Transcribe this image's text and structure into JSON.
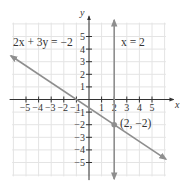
{
  "chart_data": {
    "type": "line",
    "title": "",
    "xlabel": "x",
    "ylabel": "y",
    "xlim": [
      -6.2,
      6.2
    ],
    "ylim": [
      -6.2,
      6.2
    ],
    "grid": true,
    "x_ticks": [
      -5,
      -4,
      -3,
      -2,
      -1,
      1,
      2,
      3,
      4,
      5
    ],
    "y_ticks": [
      5,
      4,
      3,
      2,
      1,
      -1,
      -2,
      -3,
      -4,
      -5
    ],
    "x_tick_labels": [
      "−5",
      "−4",
      "−3",
      "−2",
      "−1",
      "1",
      "2",
      "3",
      "4",
      "5"
    ],
    "y_tick_labels": [
      "5",
      "4",
      "3",
      "2",
      "1",
      "−1",
      "−2",
      "−3",
      "−4",
      "−5"
    ],
    "series": [
      {
        "name": "2x + 3y = −2",
        "kind": "line",
        "equation": "2x + 3y = -2",
        "x": [
          -6.2,
          6.1
        ],
        "y": [
          3.47,
          -4.73
        ],
        "arrows": "both"
      },
      {
        "name": "x = 2",
        "kind": "vertical-line",
        "equation": "x = 2",
        "x": [
          2,
          2
        ],
        "y": [
          6.3,
          -6.3
        ],
        "arrows": "both"
      }
    ],
    "points": [
      {
        "x": 2,
        "y": -2,
        "label": "(2, −2)"
      }
    ],
    "annotations": [
      {
        "text": "2x + 3y = −2",
        "near": [
          -4.5,
          4.5
        ]
      },
      {
        "text": "x = 2",
        "near": [
          3.2,
          4.3
        ]
      },
      {
        "text": "(2, −2)",
        "near": [
          3.4,
          -1.5
        ]
      }
    ]
  },
  "labels": {
    "x_axis": "x",
    "y_axis": "y",
    "eq1": "2x + 3y = −2",
    "eq2": "x = 2",
    "point": "(2, −2)"
  },
  "colors": {
    "grid": "#e4e4e4",
    "axis": "#333333",
    "line": "#8e8e8e",
    "point": "#8e8e8e",
    "text": "#333333"
  }
}
